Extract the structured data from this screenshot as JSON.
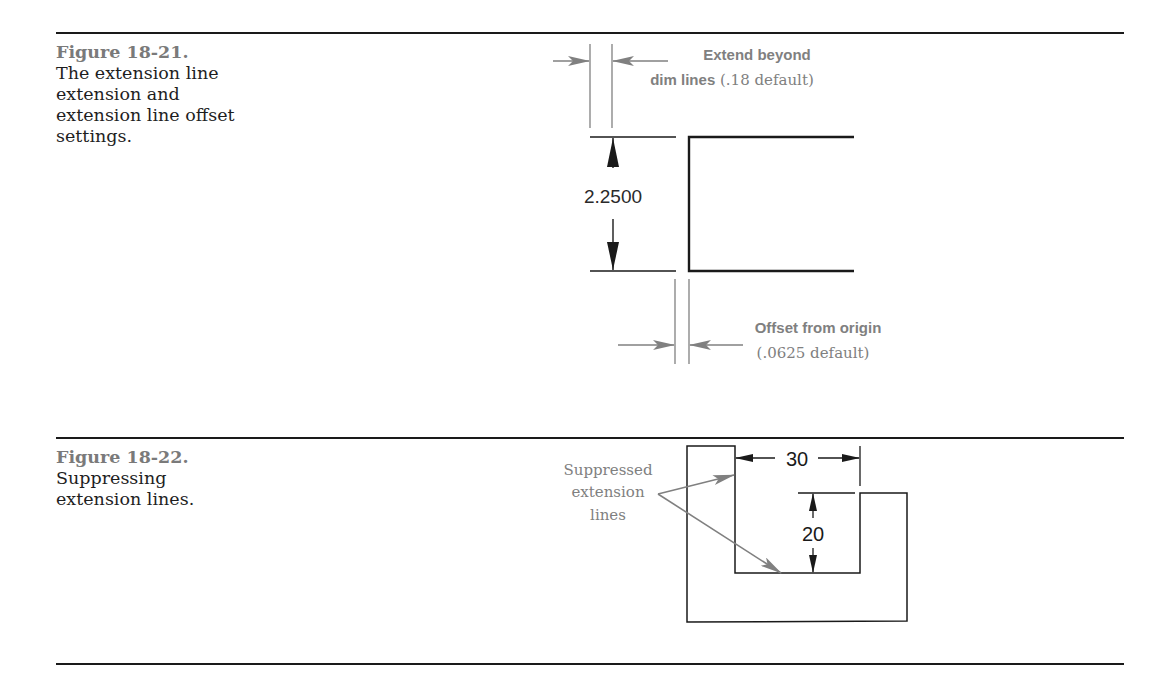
{
  "figures": [
    {
      "number": "Figure 18-21.",
      "caption": "The extension line extension and extension line offset settings.",
      "caption_lines": [
        "The extension line",
        "extension and",
        "extension line offset",
        "settings."
      ],
      "dimension_value": "2.2500",
      "callouts": {
        "extend": {
          "bold_line1": "Extend beyond",
          "bold_line2": "dim lines",
          "serif_suffix": " (.18 default)"
        },
        "offset": {
          "bold_line1": "Offset from origin",
          "serif_line2": "(.0625 default)"
        }
      }
    },
    {
      "number": "Figure 18-22.",
      "caption": "Suppressing extension lines.",
      "caption_lines": [
        "Suppressing",
        "extension lines."
      ],
      "dimension_horizontal": "30",
      "dimension_vertical": "20",
      "callout": {
        "lines": [
          "Suppressed",
          "extension",
          "lines"
        ]
      }
    }
  ],
  "colors": {
    "rule": "#1a1a1a",
    "figure_number": "#7a7a7a",
    "callout": "#808080",
    "geometry": "#1a1a1a"
  }
}
